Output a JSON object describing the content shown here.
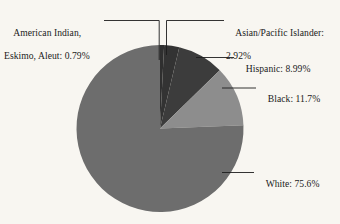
{
  "chart_data": {
    "type": "pie",
    "title": "",
    "subtitle": "",
    "xlabel": "",
    "ylabel": "",
    "legend_position": "callout-labels",
    "grid": false,
    "units": "percent",
    "start_angle_deg": 0,
    "direction": "clockwise",
    "categories": [
      "American Indian, Eskimo, Aleut",
      "Asian/Pacific Islander",
      "Hispanic",
      "Black",
      "White"
    ],
    "values": [
      0.79,
      2.92,
      8.99,
      11.7,
      75.6
    ],
    "slices": [
      {
        "name": "American Indian, Eskimo, Aleut",
        "label": "American Indian,",
        "label_line2": "Eskimo, Aleut: 0.79%",
        "value": 0.79,
        "value_text": "0.79%",
        "color": "#2f2f2f"
      },
      {
        "name": "Asian/Pacific Islander",
        "label": "Asian/Pacific Islander:",
        "label_line2": "2.92%",
        "value": 2.92,
        "value_text": "2.92%",
        "color": "#333333"
      },
      {
        "name": "Hispanic",
        "label": "Hispanic: 8.99%",
        "label_line2": "",
        "value": 8.99,
        "value_text": "8.99%",
        "color": "#3c3c3c"
      },
      {
        "name": "Black",
        "label": "Black: 11.7%",
        "label_line2": "",
        "value": 11.7,
        "value_text": "11.7%",
        "color": "#8d8d8d"
      },
      {
        "name": "White",
        "label": "White: 75.6%",
        "label_line2": "",
        "value": 75.6,
        "value_text": "75.6%",
        "color": "#6d6d6d"
      }
    ],
    "background_color": "#f8f6f1",
    "leader_line_color": "#1d1d1d"
  }
}
